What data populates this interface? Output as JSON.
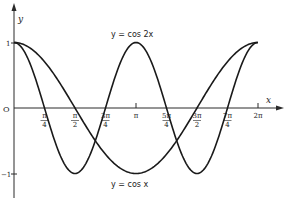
{
  "chart_data": {
    "type": "line",
    "title": "",
    "xlabel": "x",
    "ylabel": "y",
    "xlim": [
      0,
      6.2832
    ],
    "ylim": [
      -1,
      1
    ],
    "grid": false,
    "legend": "none (curves annotated inline)",
    "x_ticks": [
      {
        "value": 0.7854,
        "label_num": "π",
        "label_den": "4"
      },
      {
        "value": 1.5708,
        "label_num": "π",
        "label_den": "2"
      },
      {
        "value": 2.3562,
        "label_num": "3π",
        "label_den": "4"
      },
      {
        "value": 3.1416,
        "label_num": "π",
        "label_den": ""
      },
      {
        "value": 3.927,
        "label_num": "5π",
        "label_den": "4"
      },
      {
        "value": 4.7124,
        "label_num": "3π",
        "label_den": "2"
      },
      {
        "value": 5.4978,
        "label_num": "7π",
        "label_den": "4"
      },
      {
        "value": 6.2832,
        "label_num": "2π",
        "label_den": ""
      }
    ],
    "y_ticks": [
      {
        "value": 1,
        "label": "1"
      },
      {
        "value": 0,
        "label": "O"
      },
      {
        "value": -1,
        "label": "−1"
      }
    ],
    "series": [
      {
        "name": "y = cos x",
        "function": "cos(x)",
        "x": [
          0,
          0.7854,
          1.5708,
          2.3562,
          3.1416,
          3.927,
          4.7124,
          5.4978,
          6.2832
        ],
        "values": [
          1,
          0.707,
          0,
          -0.707,
          -1,
          -0.707,
          0,
          0.707,
          1
        ]
      },
      {
        "name": "y = cos 2x",
        "function": "cos(2x)",
        "x": [
          0,
          0.7854,
          1.5708,
          2.3562,
          3.1416,
          3.927,
          4.7124,
          5.4978,
          6.2832
        ],
        "values": [
          1,
          0,
          -1,
          0,
          1,
          0,
          -1,
          0,
          1
        ]
      }
    ],
    "annotations": [
      {
        "text": "y = cos 2x",
        "near": "peak at x=π, above curve"
      },
      {
        "text": "y = cos x",
        "near": "trough at x=π, below curve"
      }
    ]
  },
  "labels": {
    "y_axis": "y",
    "x_axis": "x",
    "origin": "O",
    "y_one": "1",
    "y_neg_one": "−1",
    "cos2x": "y = cos 2x",
    "cosx": "y = cos x"
  }
}
